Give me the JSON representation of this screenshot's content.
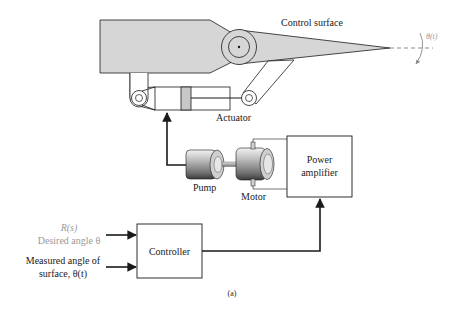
{
  "diagram": {
    "labels": {
      "control_surface": "Control surface",
      "theta_t": "θ(t)",
      "actuator": "Actuator",
      "pump": "Pump",
      "motor": "Motor",
      "power_amplifier_line1": "Power",
      "power_amplifier_line2": "amplifier",
      "controller": "Controller",
      "input_rs": "R(s)",
      "input_desired": "Desired angle θ",
      "input_measured_line1": "Measured angle of",
      "input_measured_line2": "surface, θ(t)",
      "caption": "(a)"
    },
    "colors": {
      "line": "#1a1a1a",
      "fill_gray": "#d6d6d6",
      "piston_gray": "#c8c8c8",
      "muted_text": "#9a9a9a"
    },
    "connections": [
      {
        "from": "R(s) desired angle",
        "to": "Controller"
      },
      {
        "from": "Measured angle of surface",
        "to": "Controller"
      },
      {
        "from": "Controller",
        "to": "Power amplifier"
      },
      {
        "from": "Power amplifier",
        "to": "Motor"
      },
      {
        "from": "Motor",
        "to": "Pump"
      },
      {
        "from": "Pump",
        "to": "Actuator"
      },
      {
        "from": "Actuator",
        "to": "Control surface"
      }
    ]
  }
}
